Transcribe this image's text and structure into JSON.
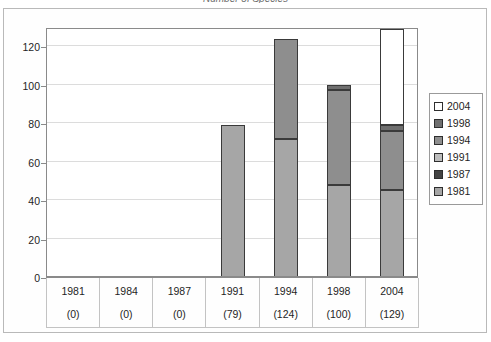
{
  "chart_data": {
    "type": "bar",
    "title": "Number of Species",
    "subtitle": "",
    "xlabel": "",
    "ylabel": "",
    "ylim": [
      0,
      130
    ],
    "yticks": [
      0,
      20,
      40,
      60,
      80,
      100,
      120
    ],
    "grid": true,
    "stacked": true,
    "legend_position": "right",
    "categories": [
      "1981",
      "1984",
      "1987",
      "1991",
      "1994",
      "1998",
      "2004"
    ],
    "category_totals": [
      0,
      0,
      0,
      79,
      124,
      100,
      129
    ],
    "category_total_labels": [
      "(0)",
      "(0)",
      "(0)",
      "(79)",
      "(124)",
      "(100)",
      "(129)"
    ],
    "series": [
      {
        "name": "1981",
        "color": "#a6a6a6",
        "values": [
          0,
          0,
          0,
          79,
          72,
          48,
          45.5
        ]
      },
      {
        "name": "1987",
        "color": "#4a4a4a",
        "values": [
          0,
          0,
          0,
          0,
          0,
          0,
          0
        ]
      },
      {
        "name": "1991",
        "color": "#bdbdbd",
        "values": [
          0,
          0,
          0,
          0,
          0,
          0,
          0
        ]
      },
      {
        "name": "1994",
        "color": "#8e8e8e",
        "values": [
          0,
          0,
          0,
          0,
          52,
          49,
          30.5
        ]
      },
      {
        "name": "1998",
        "color": "#787878",
        "values": [
          0,
          0,
          0,
          0,
          0,
          3,
          3
        ]
      },
      {
        "name": "2004",
        "color": "#ffffff",
        "values": [
          0,
          0,
          0,
          0,
          0,
          0,
          50
        ]
      }
    ],
    "legend_entries": [
      {
        "label": "2004",
        "color": "#ffffff"
      },
      {
        "label": "1998",
        "color": "#6f6f6f"
      },
      {
        "label": "1994",
        "color": "#8e8e8e"
      },
      {
        "label": "1991",
        "color": "#bdbdbd"
      },
      {
        "label": "1987",
        "color": "#434343"
      },
      {
        "label": "1981",
        "color": "#a6a6a6"
      }
    ],
    "bar_stacks": [
      {
        "category": "1981",
        "segments": []
      },
      {
        "category": "1984",
        "segments": []
      },
      {
        "category": "1987",
        "segments": []
      },
      {
        "category": "1991",
        "segments": [
          {
            "series": "1981",
            "from": 0,
            "to": 79,
            "color": "#a6a6a6"
          }
        ]
      },
      {
        "category": "1994",
        "segments": [
          {
            "series": "1981",
            "from": 0,
            "to": 72,
            "color": "#a6a6a6"
          },
          {
            "series": "1994",
            "from": 72,
            "to": 124,
            "color": "#8e8e8e"
          }
        ]
      },
      {
        "category": "1998",
        "segments": [
          {
            "series": "1981",
            "from": 0,
            "to": 48,
            "color": "#a6a6a6"
          },
          {
            "series": "1994",
            "from": 48,
            "to": 97,
            "color": "#8e8e8e"
          },
          {
            "series": "1998",
            "from": 97,
            "to": 100,
            "color": "#6f6f6f"
          }
        ]
      },
      {
        "category": "2004",
        "segments": [
          {
            "series": "1981",
            "from": 0,
            "to": 45.5,
            "color": "#a6a6a6"
          },
          {
            "series": "1994",
            "from": 45.5,
            "to": 76,
            "color": "#8e8e8e"
          },
          {
            "series": "1998",
            "from": 76,
            "to": 79,
            "color": "#6f6f6f"
          },
          {
            "series": "2004",
            "from": 79,
            "to": 129,
            "color": "#ffffff"
          }
        ]
      }
    ]
  },
  "axis": {
    "y_tick_labels": [
      "120",
      "100",
      "80",
      "60",
      "40",
      "20",
      "0"
    ]
  }
}
